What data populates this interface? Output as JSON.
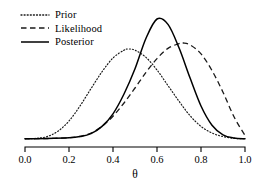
{
  "chart_data": {
    "type": "line",
    "title": "",
    "subtitle": "",
    "xlabel": "θ",
    "ylabel": "",
    "xlim": [
      0.0,
      1.0
    ],
    "ylim": [
      0.0,
      1.0
    ],
    "grid": false,
    "legend_position": "top-left",
    "xticks": [
      "0.0",
      "0.2",
      "0.4",
      "0.6",
      "0.8",
      "1.0"
    ],
    "xtick_values": [
      0.0,
      0.2,
      0.4,
      0.6,
      0.8,
      1.0
    ],
    "yticks": [],
    "series": [
      {
        "name": "Prior",
        "style": "dotted",
        "color": "#1a1a1a",
        "peak_x": 0.47,
        "peak_y": 0.75,
        "values": [
          {
            "x": 0.0,
            "y": 0.002
          },
          {
            "x": 0.05,
            "y": 0.005
          },
          {
            "x": 0.1,
            "y": 0.02
          },
          {
            "x": 0.15,
            "y": 0.065
          },
          {
            "x": 0.2,
            "y": 0.15
          },
          {
            "x": 0.25,
            "y": 0.275
          },
          {
            "x": 0.3,
            "y": 0.42
          },
          {
            "x": 0.35,
            "y": 0.56
          },
          {
            "x": 0.4,
            "y": 0.675
          },
          {
            "x": 0.45,
            "y": 0.74
          },
          {
            "x": 0.47,
            "y": 0.75
          },
          {
            "x": 0.5,
            "y": 0.74
          },
          {
            "x": 0.55,
            "y": 0.68
          },
          {
            "x": 0.6,
            "y": 0.575
          },
          {
            "x": 0.65,
            "y": 0.445
          },
          {
            "x": 0.7,
            "y": 0.315
          },
          {
            "x": 0.75,
            "y": 0.195
          },
          {
            "x": 0.8,
            "y": 0.105
          },
          {
            "x": 0.85,
            "y": 0.05
          },
          {
            "x": 0.9,
            "y": 0.02
          },
          {
            "x": 0.95,
            "y": 0.006
          },
          {
            "x": 1.0,
            "y": 0.002
          }
        ]
      },
      {
        "name": "Likelihood",
        "style": "dashed",
        "color": "#1a1a1a",
        "peak_x": 0.72,
        "peak_y": 0.8,
        "values": [
          {
            "x": 0.0,
            "y": 0.002
          },
          {
            "x": 0.1,
            "y": 0.004
          },
          {
            "x": 0.2,
            "y": 0.01
          },
          {
            "x": 0.25,
            "y": 0.022
          },
          {
            "x": 0.3,
            "y": 0.05
          },
          {
            "x": 0.35,
            "y": 0.105
          },
          {
            "x": 0.4,
            "y": 0.19
          },
          {
            "x": 0.45,
            "y": 0.3
          },
          {
            "x": 0.5,
            "y": 0.425
          },
          {
            "x": 0.55,
            "y": 0.555
          },
          {
            "x": 0.6,
            "y": 0.67
          },
          {
            "x": 0.65,
            "y": 0.755
          },
          {
            "x": 0.7,
            "y": 0.795
          },
          {
            "x": 0.72,
            "y": 0.8
          },
          {
            "x": 0.75,
            "y": 0.785
          },
          {
            "x": 0.8,
            "y": 0.71
          },
          {
            "x": 0.85,
            "y": 0.57
          },
          {
            "x": 0.9,
            "y": 0.39
          },
          {
            "x": 0.95,
            "y": 0.185
          },
          {
            "x": 1.0,
            "y": 0.03
          }
        ]
      },
      {
        "name": "Posterior",
        "style": "solid",
        "color": "#000000",
        "peak_x": 0.6,
        "peak_y": 1.0,
        "values": [
          {
            "x": 0.0,
            "y": 0.002
          },
          {
            "x": 0.1,
            "y": 0.004
          },
          {
            "x": 0.2,
            "y": 0.01
          },
          {
            "x": 0.25,
            "y": 0.02
          },
          {
            "x": 0.3,
            "y": 0.045
          },
          {
            "x": 0.35,
            "y": 0.105
          },
          {
            "x": 0.4,
            "y": 0.21
          },
          {
            "x": 0.45,
            "y": 0.375
          },
          {
            "x": 0.5,
            "y": 0.585
          },
          {
            "x": 0.55,
            "y": 0.84
          },
          {
            "x": 0.6,
            "y": 1.0
          },
          {
            "x": 0.65,
            "y": 0.955
          },
          {
            "x": 0.7,
            "y": 0.76
          },
          {
            "x": 0.75,
            "y": 0.51
          },
          {
            "x": 0.8,
            "y": 0.275
          },
          {
            "x": 0.85,
            "y": 0.115
          },
          {
            "x": 0.9,
            "y": 0.035
          },
          {
            "x": 0.95,
            "y": 0.008
          },
          {
            "x": 1.0,
            "y": 0.002
          }
        ]
      }
    ]
  },
  "legend": {
    "items": [
      {
        "label": "Prior",
        "key": "dotted-line-icon"
      },
      {
        "label": "Likelihood",
        "key": "dashed-line-icon"
      },
      {
        "label": "Posterior",
        "key": "solid-line-icon"
      }
    ]
  },
  "axis": {
    "title": "θ",
    "tick_labels": [
      "0.0",
      "0.2",
      "0.4",
      "0.6",
      "0.8",
      "1.0"
    ]
  }
}
